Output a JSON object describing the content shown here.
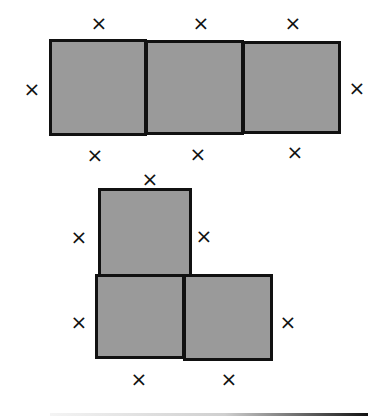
{
  "figures": [
    {
      "name": "row-of-three-squares",
      "squares": [
        {
          "left": 49,
          "top": 39,
          "width": 98,
          "height": 97
        },
        {
          "left": 145,
          "top": 40,
          "width": 99,
          "height": 95
        },
        {
          "left": 242,
          "top": 41,
          "width": 99,
          "height": 93
        }
      ],
      "marks": [
        {
          "label": "×",
          "x": 99,
          "y": 23
        },
        {
          "label": "×",
          "x": 201,
          "y": 23
        },
        {
          "label": "×",
          "x": 293,
          "y": 23
        },
        {
          "label": "×",
          "x": 32,
          "y": 89
        },
        {
          "label": "×",
          "x": 357,
          "y": 88
        },
        {
          "label": "×",
          "x": 95,
          "y": 155
        },
        {
          "label": "×",
          "x": 198,
          "y": 154
        },
        {
          "label": "×",
          "x": 295,
          "y": 152
        }
      ]
    },
    {
      "name": "l-shape-of-three-squares",
      "squares": [
        {
          "left": 98,
          "top": 188,
          "width": 94,
          "height": 89
        },
        {
          "left": 95,
          "top": 274,
          "width": 90,
          "height": 85
        },
        {
          "left": 183,
          "top": 274,
          "width": 90,
          "height": 87
        }
      ],
      "marks": [
        {
          "label": "×",
          "x": 150,
          "y": 179
        },
        {
          "label": "×",
          "x": 79,
          "y": 237
        },
        {
          "label": "×",
          "x": 204,
          "y": 236
        },
        {
          "label": "×",
          "x": 79,
          "y": 322
        },
        {
          "label": "×",
          "x": 288,
          "y": 322
        },
        {
          "label": "×",
          "x": 139,
          "y": 379
        },
        {
          "label": "×",
          "x": 229,
          "y": 379
        }
      ]
    }
  ],
  "colors": {
    "fill": "#9a9a9a",
    "stroke": "#111111"
  }
}
